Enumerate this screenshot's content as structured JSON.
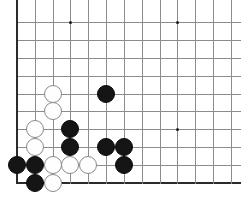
{
  "board": {
    "title": "Go Board Position",
    "type": "go-board",
    "visible_columns": 13,
    "visible_rows": 10,
    "corner": "bottom-left",
    "grid_origin_x": 17,
    "grid_origin_y": 22,
    "cell_width": 17.83,
    "cell_height": 17.89,
    "stone_diameter": 18,
    "colors": {
      "background": "#ffffff",
      "grid_line": "#8c8c8c",
      "edge_line": "#2b2b2b",
      "black_stone": "#151515",
      "white_stone": "#fefefe",
      "white_stone_outline": "#8a8a8a",
      "star_point": "#1a1a1a"
    },
    "star_points": [
      {
        "col": 3,
        "row": 0
      },
      {
        "col": 9,
        "row": 0
      },
      {
        "col": 3,
        "row": 6
      },
      {
        "col": 9,
        "row": 6
      }
    ],
    "edges": {
      "left": true,
      "bottom": true,
      "top": false,
      "right": false
    },
    "stones": [
      {
        "color": "white",
        "col": 2,
        "row": 4
      },
      {
        "color": "black",
        "col": 5,
        "row": 4
      },
      {
        "color": "white",
        "col": 2,
        "row": 5
      },
      {
        "color": "white",
        "col": 1,
        "row": 6
      },
      {
        "color": "black",
        "col": 3,
        "row": 6
      },
      {
        "color": "white",
        "col": 1,
        "row": 7
      },
      {
        "color": "black",
        "col": 3,
        "row": 7
      },
      {
        "color": "black",
        "col": 5,
        "row": 7
      },
      {
        "color": "black",
        "col": 6,
        "row": 7
      },
      {
        "color": "black",
        "col": 0,
        "row": 8
      },
      {
        "color": "black",
        "col": 1,
        "row": 8
      },
      {
        "color": "white",
        "col": 2,
        "row": 8
      },
      {
        "color": "white",
        "col": 3,
        "row": 8
      },
      {
        "color": "white",
        "col": 4,
        "row": 8
      },
      {
        "color": "black",
        "col": 6,
        "row": 8
      },
      {
        "color": "black",
        "col": 1,
        "row": 9
      },
      {
        "color": "white",
        "col": 2,
        "row": 9
      }
    ],
    "stone_counts": {
      "black": 9,
      "white": 8,
      "total": 17
    }
  }
}
